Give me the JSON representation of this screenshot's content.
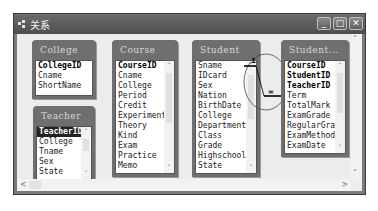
{
  "window": {
    "title": "关系",
    "buttons": {
      "minimize": "_",
      "maximize": "□",
      "close": "✕"
    }
  },
  "tables": [
    {
      "name": "College",
      "fields": [
        "CollegeID",
        "Cname",
        "ShortName"
      ],
      "primary_keys": [
        "CollegeID"
      ],
      "scrollable": false
    },
    {
      "name": "Course",
      "fields": [
        "CourseID",
        "Cname",
        "College",
        "Period",
        "Credit",
        "Experiment",
        "Theory",
        "Kind",
        "Exam",
        "Practice",
        "Memo"
      ],
      "primary_keys": [
        "CourseID"
      ],
      "scrollable": true
    },
    {
      "name": "Student",
      "fields": [
        "Sname",
        "IDcard",
        "Sex",
        "Nation",
        "BirthDate",
        "College",
        "Department",
        "Class",
        "Grade",
        "Highschool",
        "State"
      ],
      "primary_keys": [],
      "scrollable": true
    },
    {
      "name": "Student...",
      "fields": [
        "CourseID",
        "StudentID",
        "TeacherID",
        "Term",
        "TotalMark",
        "ExamGrade",
        "RegularGrad",
        "ExamMethod",
        "ExamDate"
      ],
      "primary_keys": [
        "CourseID",
        "StudentID",
        "TeacherID"
      ],
      "scrollable": true
    },
    {
      "name": "Teacher",
      "fields": [
        "TeacherID",
        "College",
        "Tname",
        "Sex",
        "State"
      ],
      "primary_keys": [
        "TeacherID"
      ],
      "selected": "TeacherID",
      "scrollable": true
    }
  ],
  "relationship": {
    "one_label": "1",
    "many_label": "∞"
  },
  "scrollbars": {
    "up": "˄",
    "down": "˅",
    "left": "<",
    "right": ">"
  }
}
